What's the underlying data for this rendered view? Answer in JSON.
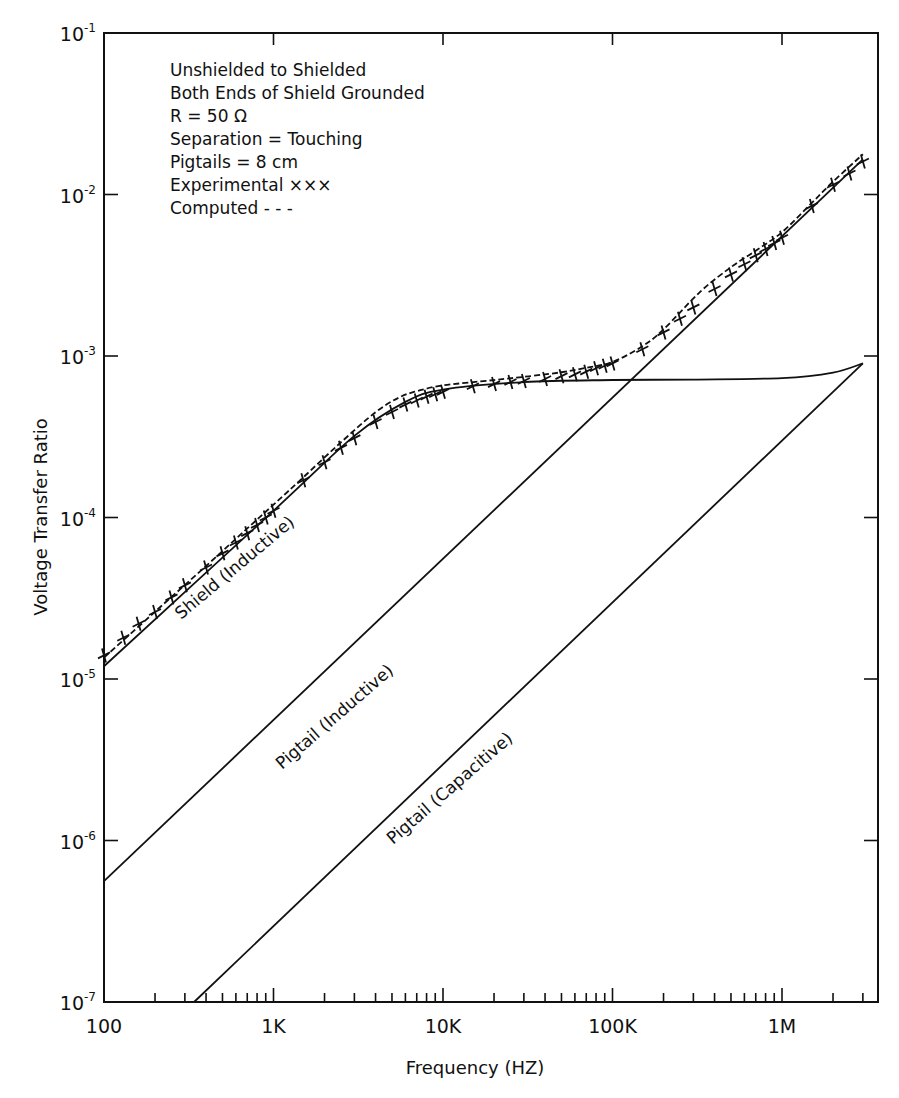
{
  "chart_data": {
    "type": "line",
    "xscale": "log",
    "yscale": "log",
    "xlabel": "Frequency  (HZ)",
    "ylabel": "Voltage Transfer Ratio",
    "xlim": [
      100,
      3000000
    ],
    "ylim": [
      1e-07,
      0.1
    ],
    "grid": false,
    "x_tick_labels": [
      "100",
      "1K",
      "10K",
      "100K",
      "1M"
    ],
    "x_tick_values": [
      100,
      1000,
      10000,
      100000,
      1000000
    ],
    "y_tick_labels": [
      {
        "base": "10",
        "exp": "-1"
      },
      {
        "base": "10",
        "exp": "-2"
      },
      {
        "base": "10",
        "exp": "-3"
      },
      {
        "base": "10",
        "exp": "-4"
      },
      {
        "base": "10",
        "exp": "-5"
      },
      {
        "base": "10",
        "exp": "-6"
      },
      {
        "base": "10",
        "exp": "-7"
      }
    ],
    "y_tick_values": [
      0.1,
      0.01,
      0.001,
      0.0001,
      1e-05,
      1e-06,
      1e-07
    ],
    "annotations": [
      "Unshielded to Shielded",
      "Both Ends of Shield Grounded",
      "R = 50 Ω",
      "Separation = Touching",
      "Pigtails = 8 cm",
      "Experimental  ×××",
      "Computed  - - -"
    ],
    "series": [
      {
        "name": "Computed (total)",
        "style": "dashed",
        "x": [
          100,
          200,
          400,
          700,
          1000,
          1500,
          2500,
          4000,
          5500,
          7000,
          10000,
          20000,
          33000,
          50000,
          70000,
          100000,
          150000,
          200000,
          330000,
          500000,
          700000,
          1000000,
          1500000,
          2000000,
          3000000
        ],
        "y": [
          1.3e-05,
          2.5e-05,
          4.8e-05,
          8.2e-05,
          0.000115,
          0.00017,
          0.00028,
          0.00043,
          0.00053,
          0.00058,
          0.00063,
          0.00068,
          0.00072,
          0.00076,
          0.00081,
          0.00088,
          0.0011,
          0.0014,
          0.0024,
          0.0034,
          0.0043,
          0.0056,
          0.0085,
          0.0115,
          0.017
        ]
      },
      {
        "name": "Experimental",
        "style": "marker-x",
        "x": [
          100,
          130,
          160,
          200,
          250,
          300,
          400,
          500,
          600,
          700,
          800,
          900,
          1000,
          1500,
          2000,
          2500,
          3000,
          4000,
          5000,
          6000,
          7000,
          8000,
          9000,
          10000,
          15000,
          20000,
          25000,
          30000,
          40000,
          50000,
          60000,
          70000,
          80000,
          90000,
          100000,
          150000,
          200000,
          250000,
          300000,
          400000,
          500000,
          600000,
          700000,
          800000,
          900000,
          1000000,
          1500000,
          2000000,
          2500000,
          3000000
        ],
        "y": [
          1.4e-05,
          1.8e-05,
          2.2e-05,
          2.6e-05,
          3.2e-05,
          3.8e-05,
          4.9e-05,
          6e-05,
          7e-05,
          8e-05,
          9e-05,
          0.0001,
          0.00011,
          0.00017,
          0.00022,
          0.00027,
          0.00031,
          0.00039,
          0.00045,
          0.0005,
          0.00053,
          0.00056,
          0.00058,
          0.0006,
          0.00065,
          0.00067,
          0.00069,
          0.0007,
          0.00072,
          0.00075,
          0.00077,
          0.0008,
          0.00084,
          0.00087,
          0.0009,
          0.0011,
          0.0014,
          0.0017,
          0.002,
          0.0026,
          0.0032,
          0.0037,
          0.0042,
          0.0046,
          0.005,
          0.0054,
          0.0085,
          0.0115,
          0.0135,
          0.016
        ]
      },
      {
        "name": "Shield (Inductive)",
        "style": "solid",
        "x": [
          100,
          1000,
          3000,
          6000,
          10000,
          30000,
          100000,
          300000,
          1000000,
          2000000,
          3000000
        ],
        "y": [
          1.2e-05,
          0.00011,
          0.00032,
          0.00052,
          0.00062,
          0.00069,
          0.00071,
          0.000715,
          0.00073,
          0.00079,
          0.0009
        ]
      },
      {
        "name": "Pigtail (Inductive)",
        "style": "solid",
        "x": [
          100,
          3000000
        ],
        "y": [
          5.6e-07,
          0.0165
        ]
      },
      {
        "name": "Pigtail (Capacitive)",
        "style": "solid",
        "x": [
          340,
          3000000
        ],
        "y": [
          1e-07,
          0.0009
        ]
      }
    ],
    "curve_labels": [
      {
        "text": "Shield (Inductive)",
        "series": "Shield (Inductive)"
      },
      {
        "text": "Pigtail (Inductive)",
        "series": "Pigtail (Inductive)"
      },
      {
        "text": "Pigtail (Capacitive)",
        "series": "Pigtail (Capacitive)"
      }
    ]
  },
  "style": {
    "ink": "#111111",
    "background": "#ffffff"
  }
}
